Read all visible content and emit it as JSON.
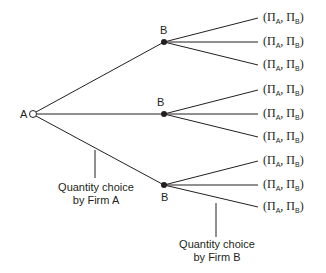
{
  "diagram": {
    "type": "game-tree",
    "root": {
      "label": "A",
      "x": 33,
      "y": 114,
      "style": "open-circle"
    },
    "nodes": [
      {
        "label": "B",
        "x": 164,
        "y": 42,
        "label_pos": "above"
      },
      {
        "label": "B",
        "x": 164,
        "y": 114,
        "label_pos": "above"
      },
      {
        "label": "B",
        "x": 164,
        "y": 185,
        "label_pos": "below"
      }
    ],
    "payoff_label": {
      "open": "(",
      "pi": "Π",
      "sub_a": "A",
      "sep": ", ",
      "sub_b": "B",
      "close": ")"
    },
    "leaves_y": [
      18,
      42,
      65,
      90,
      114,
      137,
      161,
      185,
      207
    ],
    "captions": {
      "firm_a": {
        "line1": "Quantity choice",
        "line2": "by Firm A"
      },
      "firm_b": {
        "line1": "Quantity choice",
        "line2": "by Firm B"
      }
    },
    "colors": {
      "line": "#231f20",
      "background": "#ffffff"
    }
  }
}
